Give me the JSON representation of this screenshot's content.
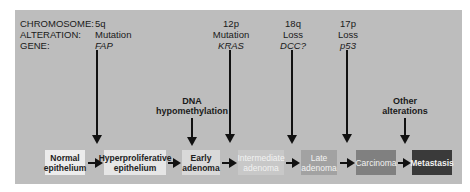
{
  "labels": {
    "chromosome": "CHROMOSOME:",
    "alteration": "ALTERATION:",
    "gene": "GENE:"
  },
  "events": [
    {
      "chromosome": "5q",
      "alteration": "Mutation",
      "gene": "FAP"
    },
    {
      "chromosome": "12p",
      "alteration": "Mutation",
      "gene": "KRAS"
    },
    {
      "chromosome": "18q",
      "alteration": "Loss",
      "gene": "DCC?"
    },
    {
      "chromosome": "17p",
      "alteration": "Loss",
      "gene": "p53"
    }
  ],
  "side_events": [
    {
      "line1": "DNA",
      "line2": "hypomethylation"
    },
    {
      "line1": "Other",
      "line2": "alterations"
    }
  ],
  "stages": [
    {
      "line1": "Normal",
      "line2": "epithelium",
      "bg": "#ececec",
      "fg": "#222222"
    },
    {
      "line1": "Hyperproliferative",
      "line2": "epithelium",
      "bg": "#e6e6e6",
      "fg": "#222222"
    },
    {
      "line1": "Early",
      "line2": "adenoma",
      "bg": "#d9d9d9",
      "fg": "#222222"
    },
    {
      "line1": "Intermediate",
      "line2": "adenoma",
      "bg": "#c8c8c8",
      "fg": "#f2f2f2"
    },
    {
      "line1": "Late",
      "line2": "adenoma",
      "bg": "#a2a2a2",
      "fg": "#f2f2f2"
    },
    {
      "line1": "Carcinoma",
      "line2": "",
      "bg": "#808080",
      "fg": "#f2f2f2"
    },
    {
      "line1": "Metastasis",
      "line2": "",
      "bg": "#3a3a3a",
      "fg": "#f2f2f2"
    }
  ]
}
